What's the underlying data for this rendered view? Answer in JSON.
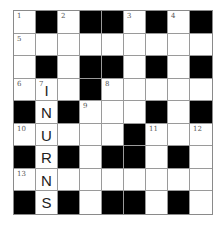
{
  "puzzle": {
    "rows": 9,
    "cols": 9,
    "grid": [
      [
        "1",
        "#",
        "2",
        "#",
        "#",
        "3",
        "#",
        "4",
        "#"
      ],
      [
        "5",
        "",
        "",
        "",
        "",
        "",
        "",
        "",
        ""
      ],
      [
        "",
        "#",
        "",
        "#",
        "#",
        "",
        "#",
        "",
        "#"
      ],
      [
        "6",
        "7",
        "",
        "#",
        "8",
        "",
        "",
        "",
        ""
      ],
      [
        "#",
        "",
        "#",
        "9",
        "",
        "",
        "#",
        "",
        "#"
      ],
      [
        "10",
        "",
        "",
        "",
        "",
        "#",
        "11",
        "",
        "12"
      ],
      [
        "#",
        "",
        "#",
        "",
        "#",
        "#",
        "",
        "#",
        ""
      ],
      [
        "13",
        "",
        "",
        "",
        "",
        "",
        "",
        "",
        ""
      ],
      [
        "#",
        "",
        "#",
        "",
        "#",
        "#",
        "",
        "#",
        ""
      ]
    ],
    "letters": {
      "3-1": "I",
      "4-1": "N",
      "5-1": "U",
      "6-1": "R",
      "7-1": "N",
      "8-1": "S"
    },
    "colors": {
      "block": "#000000",
      "cell": "#ffffff",
      "line": "#9a9a9a"
    }
  }
}
